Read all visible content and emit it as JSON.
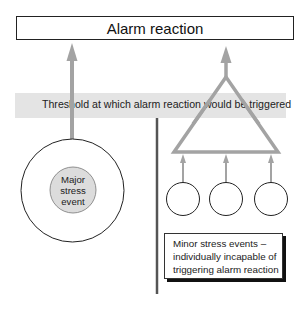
{
  "diagram": {
    "title": "Alarm reaction",
    "threshold_label": "Threshold at which alarm reaction would be triggered",
    "major_event": {
      "lines": [
        "Major",
        "stress",
        "event"
      ]
    },
    "minor_events": {
      "count": 3,
      "callout_lines": [
        "Minor stress events –",
        "individually incapable of",
        "triggering alarm reaction"
      ]
    },
    "colors": {
      "arrow_gray": "#a3a3a3",
      "threshold_band": "#e4e4e4",
      "inner_circle_fill": "#dcdcdc",
      "divider": "#555555",
      "outline": "#222222",
      "callout_shadow": "#111111"
    }
  }
}
